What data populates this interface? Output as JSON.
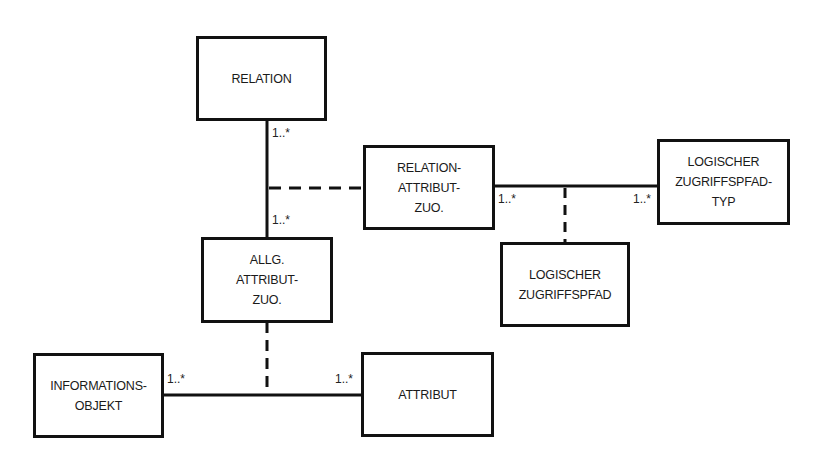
{
  "entities": [
    {
      "id": "relation",
      "label": "RELATION",
      "x": 196,
      "y": 36,
      "w": 131,
      "h": 85
    },
    {
      "id": "relation-attribut-zuo",
      "label": "RELATION-\nATTRIBUT-\nZUO.",
      "x": 363,
      "y": 145,
      "w": 132,
      "h": 85
    },
    {
      "id": "logischer-zugriffspfad-typ",
      "label": "LOGISCHER\nZUGRIFFSPFAD-\nTYP",
      "x": 657,
      "y": 139,
      "w": 133,
      "h": 86
    },
    {
      "id": "logischer-zugriffspfad",
      "label": "LOGISCHER\nZUGRIFFSPFAD",
      "x": 500,
      "y": 242,
      "w": 130,
      "h": 85
    },
    {
      "id": "allg-attribut-zuo",
      "label": "ALLG.\nATTRIBUT-\nZUO.",
      "x": 201,
      "y": 237,
      "w": 132,
      "h": 86
    },
    {
      "id": "informationsobjekt",
      "label": "INFORMATIONS-\nOBJEKT",
      "x": 33,
      "y": 353,
      "w": 131,
      "h": 85
    },
    {
      "id": "attribut",
      "label": "ATTRIBUT",
      "x": 361,
      "y": 352,
      "w": 133,
      "h": 85
    }
  ],
  "multiplicities": [
    {
      "text": "1..*",
      "x": 272,
      "y": 126
    },
    {
      "text": "1..*",
      "x": 272,
      "y": 213
    },
    {
      "text": "1..*",
      "x": 498,
      "y": 192
    },
    {
      "text": "1..*",
      "x": 633,
      "y": 192
    },
    {
      "text": "1..*",
      "x": 167,
      "y": 372
    },
    {
      "text": "1..*",
      "x": 335,
      "y": 372
    }
  ]
}
